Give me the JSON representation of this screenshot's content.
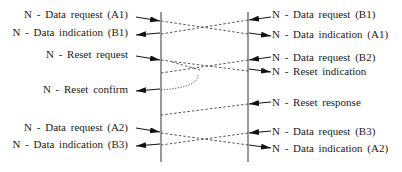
{
  "diagram": {
    "type": "time-sequence",
    "lifelines": [
      {
        "id": "A",
        "x": 161
      },
      {
        "id": "B",
        "x": 248
      }
    ],
    "left_labels": [
      {
        "text": "N - Data request (A1)",
        "y": 13
      },
      {
        "text": "N - Data indication (B1)",
        "y": 31
      },
      {
        "text": "N - Reset request",
        "y": 53
      },
      {
        "text": "N - Reset confirm",
        "y": 87
      },
      {
        "text": "N - Data request (A2)",
        "y": 125
      },
      {
        "text": "N - Data indication (B3)",
        "y": 142
      }
    ],
    "right_labels": [
      {
        "text": "N - Data request (B1)",
        "y": 13
      },
      {
        "text": "N - Data indication (A1)",
        "y": 32
      },
      {
        "text": "N - Data request (B2)",
        "y": 54
      },
      {
        "text": "N - Reset indication",
        "y": 68
      },
      {
        "text": "N - Reset response",
        "y": 99
      },
      {
        "text": "N - Data request (B3)",
        "y": 128
      },
      {
        "text": "N - Data indication (A2)",
        "y": 145
      }
    ],
    "messages": [
      {
        "from": "A",
        "to": "B",
        "label": "Data (A1)",
        "y_start": 19,
        "y_end": 34,
        "style": "dashed"
      },
      {
        "from": "B",
        "to": "A",
        "label": "Data (B1)",
        "y_start": 19,
        "y_end": 34,
        "style": "dashed"
      },
      {
        "from": "A",
        "to": "B",
        "label": "Reset",
        "y_start": 58,
        "y_end": 70,
        "style": "dashed"
      },
      {
        "from": "B",
        "to": "A",
        "label": "Data (B2) discarded",
        "y_start": 58,
        "y_end": 72,
        "style": "dashed"
      },
      {
        "from": "A",
        "to": "A",
        "label": "Reset confirm (local)",
        "y_start": 75,
        "y_end": 90,
        "style": "dotted"
      },
      {
        "from": "B",
        "to": "A",
        "label": "Reset response",
        "y_start": 104,
        "y_end": 114,
        "style": "dashed"
      },
      {
        "from": "A",
        "to": "B",
        "label": "Data (A2)",
        "y_start": 132,
        "y_end": 145,
        "style": "dashed"
      },
      {
        "from": "B",
        "to": "A",
        "label": "Data (B3)",
        "y_start": 132,
        "y_end": 145,
        "style": "dashed"
      }
    ]
  }
}
